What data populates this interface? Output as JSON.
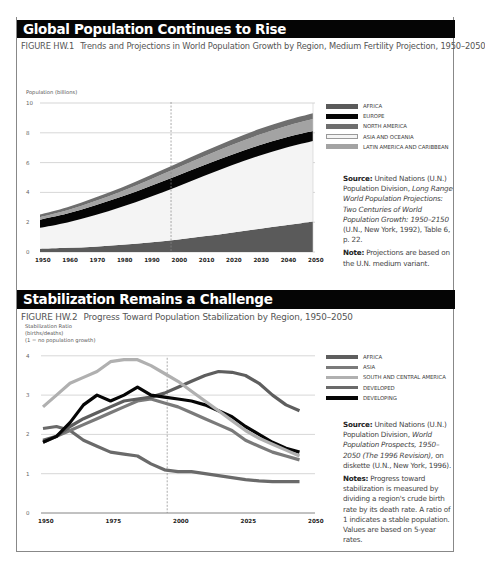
{
  "sections": [
    {
      "title": "Global Population Continues to Rise",
      "figure_number": "FIGURE HW.1",
      "figure_title": "Trends and Projections in World Population Growth by Region, Medium Fertility Projection, 1950–2050",
      "y_axis_label": "Population (billions)",
      "legend": [
        {
          "label": "AFRICA",
          "color": "#5a5a5a"
        },
        {
          "label": "EUROPE",
          "color": "#050505"
        },
        {
          "label": "NORTH AMERICA",
          "color": "#6e6e6e"
        },
        {
          "label": "ASIA AND OCEANIA",
          "color": "#f4f4f4"
        },
        {
          "label": "LATIN AMERICA AND CARIBBEAN",
          "color": "#a3a3a3"
        }
      ],
      "source_label": "Source:",
      "source_text_1": "United Nations (U.N.) Population Division,",
      "source_italic": "Long Range World Population Projections: Two Centuries of World Population Growth: 1950–2150",
      "source_text_2": "(U.N., New York, 1992), Table 6, p. 22.",
      "note_label": "Note:",
      "note_text": "Projections are based on the U.N. medium variant."
    },
    {
      "title": "Stabilization Remains a Challenge",
      "figure_number": "FIGURE HW.2",
      "figure_title": "Progress Toward Population Stabilization by Region, 1950–2050",
      "y_axis_label_1": "Stabilization Ratio",
      "y_axis_label_2": "(births/deaths)",
      "y_axis_label_3": "(1 = no population growth)",
      "legend": [
        {
          "label": "AFRICA",
          "color": "#5e5e5e"
        },
        {
          "label": "ASIA",
          "color": "#7a7a7a"
        },
        {
          "label": "SOUTH AND CENTRAL AMERICA",
          "color": "#b0b0b0"
        },
        {
          "label": "DEVELOPED",
          "color": "#6a6a6a"
        },
        {
          "label": "DEVELOPING",
          "color": "#050505"
        }
      ],
      "source_label": "Source:",
      "source_text_1": "United Nations (U.N.) Population Division,",
      "source_italic": "World Population Prospects, 1950–2050 (The 1996 Revision),",
      "source_text_2": "on diskette (U.N., New York, 1996).",
      "note_label": "Notes:",
      "note_text": "Progress toward stabilization is measured by dividing a region's crude birth rate by its death rate. A ratio of 1 indicates a stable population. Values are based on 5-year rates."
    }
  ],
  "chart_data": [
    {
      "type": "area",
      "stacked": true,
      "title": "Trends and Projections in World Population Growth by Region, Medium Fertility Projection, 1950–2050",
      "xlabel": "",
      "ylabel": "Population (billions)",
      "ylim": [
        0,
        10
      ],
      "yticks": [
        0,
        2,
        4,
        6,
        8,
        10
      ],
      "x": [
        1950,
        1960,
        1970,
        1980,
        1990,
        2000,
        2010,
        2020,
        2030,
        2040,
        2050
      ],
      "xtick_labels": [
        "1950",
        "1960",
        "1970",
        "1980",
        "1990",
        "2000",
        "2010",
        "2020",
        "2030",
        "2040",
        "2050"
      ],
      "projection_start": 1998,
      "grid": true,
      "legend_position": "right",
      "series": [
        {
          "name": "AFRICA",
          "values": [
            0.22,
            0.28,
            0.36,
            0.48,
            0.63,
            0.82,
            1.05,
            1.3,
            1.55,
            1.8,
            2.05
          ]
        },
        {
          "name": "ASIA AND OCEANIA",
          "values": [
            1.4,
            1.7,
            2.1,
            2.55,
            3.05,
            3.55,
            4.05,
            4.5,
            4.9,
            5.2,
            5.4
          ]
        },
        {
          "name": "EUROPE",
          "values": [
            0.55,
            0.6,
            0.66,
            0.69,
            0.72,
            0.73,
            0.72,
            0.71,
            0.7,
            0.69,
            0.67
          ]
        },
        {
          "name": "LATIN AMERICA AND CARIBBEAN",
          "values": [
            0.17,
            0.22,
            0.29,
            0.36,
            0.44,
            0.52,
            0.59,
            0.65,
            0.7,
            0.75,
            0.8
          ]
        },
        {
          "name": "NORTH AMERICA",
          "values": [
            0.17,
            0.2,
            0.23,
            0.25,
            0.28,
            0.31,
            0.33,
            0.36,
            0.38,
            0.39,
            0.4
          ]
        }
      ]
    },
    {
      "type": "line",
      "title": "Progress Toward Population Stabilization by Region, 1950–2050",
      "xlabel": "",
      "ylabel": "Stabilization Ratio (births/deaths) (1 = no population growth)",
      "ylim": [
        0,
        4
      ],
      "yticks": [
        0,
        1,
        2,
        3,
        4
      ],
      "xlim": [
        1950,
        2050
      ],
      "xtick_labels": [
        "1950",
        "1975",
        "2000",
        "2025",
        "2050"
      ],
      "projection_start": 1996,
      "grid": true,
      "legend_position": "right",
      "x": [
        1950,
        1955,
        1960,
        1965,
        1970,
        1975,
        1980,
        1985,
        1990,
        1995,
        2000,
        2005,
        2010,
        2015,
        2020,
        2025,
        2030,
        2035,
        2040,
        2045
      ],
      "series": [
        {
          "name": "AFRICA",
          "values": [
            1.85,
            1.95,
            2.2,
            2.4,
            2.55,
            2.7,
            2.85,
            2.9,
            2.95,
            3.05,
            3.2,
            3.35,
            3.5,
            3.6,
            3.58,
            3.5,
            3.3,
            3.0,
            2.75,
            2.6
          ]
        },
        {
          "name": "ASIA",
          "values": [
            1.8,
            1.95,
            2.1,
            2.25,
            2.4,
            2.55,
            2.7,
            2.85,
            2.9,
            2.8,
            2.7,
            2.55,
            2.4,
            2.25,
            2.1,
            1.85,
            1.7,
            1.55,
            1.45,
            1.35
          ]
        },
        {
          "name": "SOUTH AND CENTRAL AMERICA",
          "values": [
            2.7,
            3.0,
            3.3,
            3.45,
            3.6,
            3.85,
            3.9,
            3.9,
            3.75,
            3.55,
            3.35,
            3.1,
            2.85,
            2.6,
            2.35,
            2.1,
            1.9,
            1.75,
            1.6,
            1.45
          ]
        },
        {
          "name": "DEVELOPED",
          "values": [
            2.15,
            2.2,
            2.1,
            1.85,
            1.7,
            1.55,
            1.5,
            1.45,
            1.25,
            1.1,
            1.05,
            1.05,
            1.0,
            0.95,
            0.9,
            0.85,
            0.82,
            0.8,
            0.8,
            0.8
          ]
        },
        {
          "name": "DEVELOPING",
          "values": [
            1.8,
            1.95,
            2.3,
            2.75,
            3.0,
            2.85,
            3.0,
            3.2,
            3.0,
            2.95,
            2.9,
            2.85,
            2.75,
            2.6,
            2.45,
            2.2,
            2.0,
            1.8,
            1.65,
            1.55
          ]
        }
      ]
    }
  ]
}
